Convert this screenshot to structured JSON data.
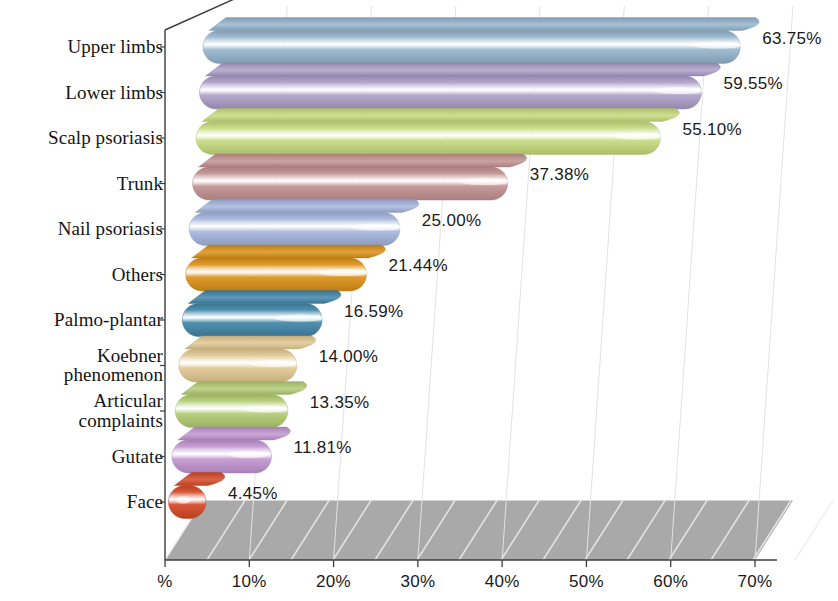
{
  "chart_data": {
    "type": "bar",
    "orientation": "horizontal",
    "style": "3d-rounded-bars",
    "title": "",
    "subtitle": "",
    "xlabel": "",
    "ylabel": "",
    "xlim": [
      0,
      70
    ],
    "grid": true,
    "legend": false,
    "categories": [
      "Upper limbs",
      "Lower limbs",
      "Scalp psoriasis",
      "Trunk",
      "Nail psoriasis",
      "Others",
      "Palmo-plantar",
      "Koebner\nphenomenon",
      "Articular\ncomplaints",
      "Gutate",
      "Face"
    ],
    "values": [
      63.75,
      59.55,
      55.1,
      37.38,
      25.0,
      21.44,
      16.59,
      14.0,
      13.35,
      11.81,
      4.45
    ],
    "value_labels": [
      "63.75%",
      "59.55%",
      "55.10%",
      "37.38%",
      "25.00%",
      "21.44%",
      "16.59%",
      "14.00%",
      "13.35%",
      "11.81%",
      "4.45%"
    ],
    "bar_colors": [
      "#9fbcd0",
      "#b6a8cd",
      "#cbdd8a",
      "#c79a9a",
      "#aebcdf",
      "#e09a2a",
      "#4f90b0",
      "#e3cc9c",
      "#b9d07f",
      "#c79fd4",
      "#d9563a"
    ],
    "bar_top_colors": [
      "#7e9cb4",
      "#9387ad",
      "#adbf6b",
      "#a97e7e",
      "#8e9cbf",
      "#bd7d16",
      "#3a7390",
      "#c6ae7d",
      "#9bb062",
      "#a980b6",
      "#b6401f"
    ],
    "x_ticks": [
      0,
      10,
      20,
      30,
      40,
      50,
      60,
      70
    ],
    "x_tick_labels": [
      "%",
      "10%",
      "20%",
      "30%",
      "40%",
      "50%",
      "60%",
      "70%"
    ],
    "floor_color": "#a9a9a9",
    "axis_color": "#3c3c3c",
    "gridline_color": "#e2e2e2"
  }
}
